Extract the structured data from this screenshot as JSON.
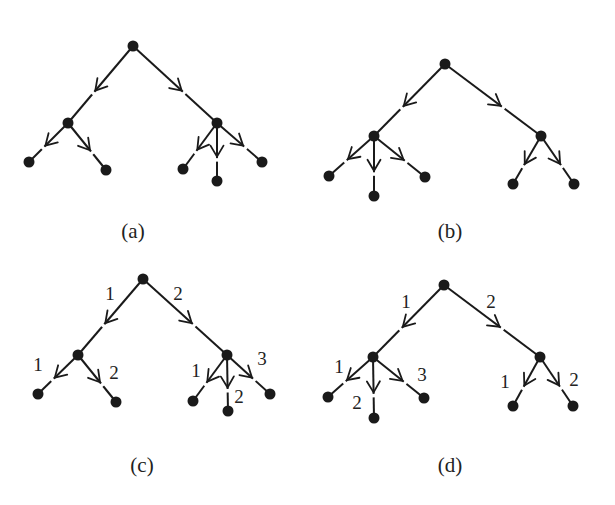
{
  "figure": {
    "panels": [
      {
        "id": "a",
        "caption": "(a)",
        "caption_pos": [
          133,
          238
        ],
        "nodes": [
          {
            "id": "r",
            "x": 133,
            "y": 46
          },
          {
            "id": "L",
            "x": 68,
            "y": 123
          },
          {
            "id": "R",
            "x": 217,
            "y": 123
          },
          {
            "id": "L1",
            "x": 29,
            "y": 162
          },
          {
            "id": "L2",
            "x": 106,
            "y": 170
          },
          {
            "id": "R1",
            "x": 183,
            "y": 169
          },
          {
            "id": "R2",
            "x": 217,
            "y": 181
          },
          {
            "id": "R3",
            "x": 262,
            "y": 162
          }
        ],
        "edges": [
          {
            "from": "r",
            "to": "L",
            "label": ""
          },
          {
            "from": "r",
            "to": "R",
            "label": ""
          },
          {
            "from": "L",
            "to": "L1",
            "label": ""
          },
          {
            "from": "L",
            "to": "L2",
            "label": ""
          },
          {
            "from": "R",
            "to": "R1",
            "label": ""
          },
          {
            "from": "R",
            "to": "R2",
            "label": ""
          },
          {
            "from": "R",
            "to": "R3",
            "label": ""
          }
        ]
      },
      {
        "id": "b",
        "caption": "(b)",
        "caption_pos": [
          450,
          238
        ],
        "nodes": [
          {
            "id": "r",
            "x": 445,
            "y": 64
          },
          {
            "id": "L",
            "x": 374,
            "y": 136
          },
          {
            "id": "R",
            "x": 541,
            "y": 136
          },
          {
            "id": "L1",
            "x": 329,
            "y": 176
          },
          {
            "id": "L2",
            "x": 374,
            "y": 196
          },
          {
            "id": "L3",
            "x": 425,
            "y": 177
          },
          {
            "id": "R1",
            "x": 513,
            "y": 184
          },
          {
            "id": "R2",
            "x": 574,
            "y": 184
          }
        ],
        "edges": [
          {
            "from": "r",
            "to": "L",
            "label": ""
          },
          {
            "from": "r",
            "to": "R",
            "label": ""
          },
          {
            "from": "L",
            "to": "L1",
            "label": ""
          },
          {
            "from": "L",
            "to": "L2",
            "label": ""
          },
          {
            "from": "L",
            "to": "L3",
            "label": ""
          },
          {
            "from": "R",
            "to": "R1",
            "label": ""
          },
          {
            "from": "R",
            "to": "R2",
            "label": ""
          }
        ]
      },
      {
        "id": "c",
        "caption": "(c)",
        "caption_pos": [
          142,
          472
        ],
        "nodes": [
          {
            "id": "r",
            "x": 143,
            "y": 279
          },
          {
            "id": "L",
            "x": 78,
            "y": 355
          },
          {
            "id": "R",
            "x": 227,
            "y": 355
          },
          {
            "id": "L1",
            "x": 38,
            "y": 394
          },
          {
            "id": "L2",
            "x": 116,
            "y": 402
          },
          {
            "id": "R1",
            "x": 193,
            "y": 401
          },
          {
            "id": "R2",
            "x": 228,
            "y": 411
          },
          {
            "id": "R3",
            "x": 270,
            "y": 394
          }
        ],
        "edges": [
          {
            "from": "r",
            "to": "L",
            "label": "1",
            "lx": 110,
            "ly": 300
          },
          {
            "from": "r",
            "to": "R",
            "label": "2",
            "lx": 178,
            "ly": 300
          },
          {
            "from": "L",
            "to": "L1",
            "label": "1",
            "lx": 38,
            "ly": 371
          },
          {
            "from": "L",
            "to": "L2",
            "label": "2",
            "lx": 114,
            "ly": 379
          },
          {
            "from": "R",
            "to": "R1",
            "label": "1",
            "lx": 196,
            "ly": 377
          },
          {
            "from": "R",
            "to": "R2",
            "label": "2",
            "lx": 239,
            "ly": 403
          },
          {
            "from": "R",
            "to": "R3",
            "label": "3",
            "lx": 262,
            "ly": 365
          }
        ]
      },
      {
        "id": "d",
        "caption": "(d)",
        "caption_pos": [
          450,
          472
        ],
        "nodes": [
          {
            "id": "r",
            "x": 444,
            "y": 285
          },
          {
            "id": "L",
            "x": 373,
            "y": 357
          },
          {
            "id": "R",
            "x": 540,
            "y": 357
          },
          {
            "id": "L1",
            "x": 328,
            "y": 397
          },
          {
            "id": "L2",
            "x": 374,
            "y": 418
          },
          {
            "id": "L3",
            "x": 424,
            "y": 398
          },
          {
            "id": "R1",
            "x": 513,
            "y": 406
          },
          {
            "id": "R2",
            "x": 573,
            "y": 406
          }
        ],
        "edges": [
          {
            "from": "r",
            "to": "L",
            "label": "1",
            "lx": 406,
            "ly": 308
          },
          {
            "from": "r",
            "to": "R",
            "label": "2",
            "lx": 491,
            "ly": 308
          },
          {
            "from": "L",
            "to": "L1",
            "label": "1",
            "lx": 339,
            "ly": 373
          },
          {
            "from": "L",
            "to": "L2",
            "label": "2",
            "lx": 357,
            "ly": 409
          },
          {
            "from": "L",
            "to": "L3",
            "label": "3",
            "lx": 422,
            "ly": 381
          },
          {
            "from": "R",
            "to": "R1",
            "label": "1",
            "lx": 505,
            "ly": 388
          },
          {
            "from": "R",
            "to": "R2",
            "label": "2",
            "lx": 574,
            "ly": 386
          }
        ]
      }
    ]
  }
}
